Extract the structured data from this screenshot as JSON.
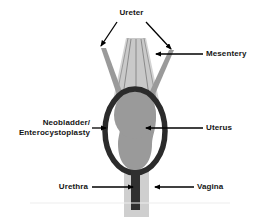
{
  "figure": {
    "background_color": "#ffffff"
  },
  "colors": {
    "outline_dark": "#2b2b2b",
    "organ_gray": "#9a9a9a",
    "mesentery_light": "#d4d4d4",
    "mesentery_line": "#6f6f6f",
    "vagina_light": "#cfcfcf",
    "urethra_dark": "#303030",
    "label_text": "#151515",
    "leader_line": "#000000",
    "frame_line": "#e8e8e8"
  },
  "labels": [
    {
      "id": "ureter",
      "text": "Ureter",
      "x": 112,
      "y": 9,
      "align": "center"
    },
    {
      "id": "mesentery",
      "text": "Mesentery",
      "x": 205,
      "y": 50,
      "align": "left"
    },
    {
      "id": "neobladder",
      "line1": "Neobladder/",
      "line2": "Enterocystoplasty",
      "x": 12,
      "y": 118,
      "align": "right"
    },
    {
      "id": "uterus",
      "text": "Uterus",
      "x": 206,
      "y": 124,
      "align": "left"
    },
    {
      "id": "urethra",
      "text": "Urethra",
      "x": 60,
      "y": 183,
      "align": "left"
    },
    {
      "id": "vagina",
      "text": "Vagina",
      "x": 196,
      "y": 183,
      "align": "left"
    }
  ],
  "anatomy": {
    "neobladder": {
      "name": "Neobladder / Enterocystoplasty",
      "shape": "ellipse-ring",
      "cx": 135,
      "cy": 131,
      "rx": 33,
      "ry": 45,
      "stroke_width": 6
    },
    "uterus": {
      "name": "Uterus",
      "shape": "pear",
      "fill": "#9a9a9a"
    },
    "mesentery": {
      "name": "Mesentery",
      "shape": "trapezoid-fan",
      "fill": "#d4d4d4",
      "internal_lines": 3
    },
    "ureters": {
      "name": "Ureter",
      "count": 2,
      "fill": "#9a9a9a",
      "orientation": "splayed-outward"
    },
    "vagina": {
      "name": "Vagina",
      "shape": "vertical-band",
      "fill": "#cfcfcf",
      "x": 124,
      "y": 172,
      "width": 25,
      "height": 45
    },
    "urethra": {
      "name": "Urethra",
      "shape": "vertical-band",
      "fill": "#303030",
      "x": 131,
      "y": 172,
      "width": 9,
      "height": 40
    }
  },
  "leaders": [
    {
      "id": "ureter-left-arrow",
      "from": [
        117,
        22
      ],
      "to": [
        100,
        47
      ]
    },
    {
      "id": "ureter-right-arrow",
      "from": [
        146,
        22
      ],
      "to": [
        172,
        50
      ]
    },
    {
      "id": "mesentery-arrow",
      "from": [
        203,
        54
      ],
      "to": [
        155,
        54
      ]
    },
    {
      "id": "neobladder-arrow",
      "from": [
        92,
        128
      ],
      "to": [
        107,
        128
      ]
    },
    {
      "id": "uterus-arrow",
      "from": [
        203,
        128
      ],
      "to": [
        145,
        128
      ]
    },
    {
      "id": "urethra-arrow",
      "from": [
        92,
        187
      ],
      "to": [
        134,
        187
      ]
    },
    {
      "id": "vagina-arrow",
      "from": [
        194,
        187
      ],
      "to": [
        154,
        187
      ]
    }
  ]
}
